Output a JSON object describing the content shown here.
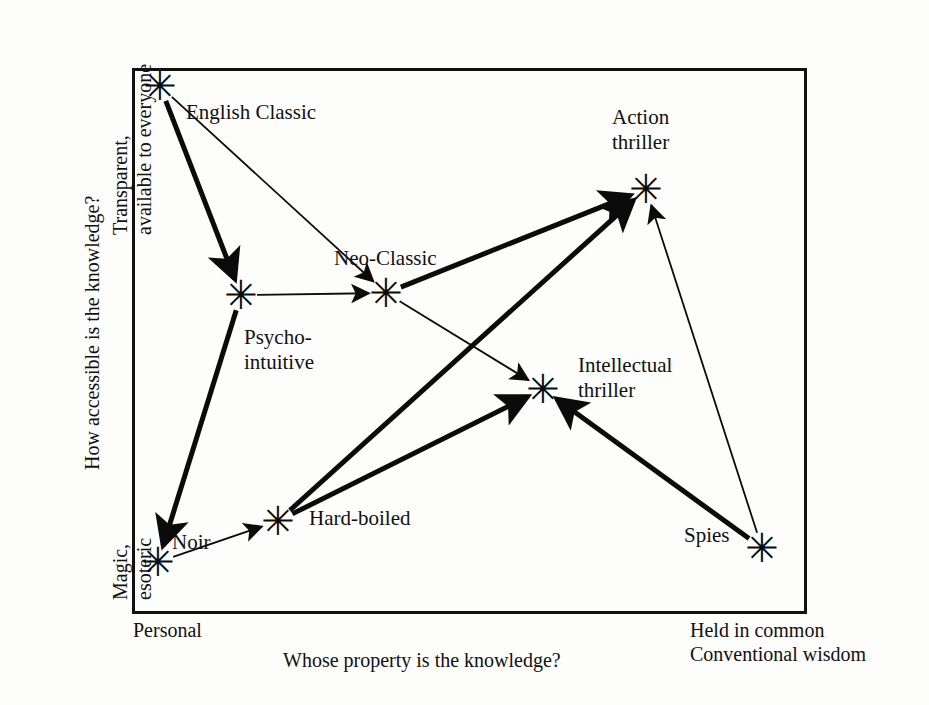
{
  "figure": {
    "kind": "two-axis positioning diagram",
    "frame": {
      "x": 132,
      "y": 68,
      "width": 675,
      "height": 546,
      "border_color": "#111111"
    },
    "background_color": "#fdfdfc"
  },
  "axes": {
    "y": {
      "title": "How accessible is the knowledge?",
      "high_label": "Transparent,\navailable to everyone",
      "low_label": "Magic,\nesoteric"
    },
    "x": {
      "title": "Whose property is the knowledge?",
      "low_label": "Personal",
      "high_label": "Held in common\nConventional wisdom"
    }
  },
  "nodes": [
    {
      "id": "english-classic",
      "label": "English Classic",
      "marker": "✳",
      "x": 160,
      "y": 86,
      "label_x": 186,
      "label_y": 100
    },
    {
      "id": "psycho-intuitive",
      "label": "Psycho-\nintuitive",
      "marker": "✳",
      "x": 241,
      "y": 295,
      "label_x": 244,
      "label_y": 325
    },
    {
      "id": "neo-classic",
      "label": "Neo-Classic",
      "marker": "✳",
      "x": 386,
      "y": 293,
      "label_x": 334,
      "label_y": 246
    },
    {
      "id": "action-thriller",
      "label": "Action\nthriller",
      "marker": "✳",
      "x": 646,
      "y": 189,
      "label_x": 612,
      "label_y": 105
    },
    {
      "id": "intellectual-thriller",
      "label": "Intellectual\nthriller",
      "marker": "✳",
      "x": 543,
      "y": 389,
      "label_x": 578,
      "label_y": 353
    },
    {
      "id": "hard-boiled",
      "label": "Hard-boiled",
      "marker": "✳",
      "x": 278,
      "y": 521,
      "label_x": 309,
      "label_y": 506
    },
    {
      "id": "noir",
      "label": "Noir",
      "marker": "✳",
      "x": 158,
      "y": 562,
      "label_x": 172,
      "label_y": 530
    },
    {
      "id": "spies",
      "label": "Spies",
      "marker": "✳",
      "x": 762,
      "y": 548,
      "label_x": 684,
      "label_y": 523
    }
  ],
  "edges": [
    {
      "from": "english-classic",
      "to": "psycho-intuitive",
      "weight": "thick"
    },
    {
      "from": "english-classic",
      "to": "neo-classic",
      "weight": "thin"
    },
    {
      "from": "psycho-intuitive",
      "to": "neo-classic",
      "weight": "thin"
    },
    {
      "from": "psycho-intuitive",
      "to": "noir",
      "weight": "thick"
    },
    {
      "from": "neo-classic",
      "to": "action-thriller",
      "weight": "thick"
    },
    {
      "from": "neo-classic",
      "to": "intellectual-thriller",
      "weight": "thin"
    },
    {
      "from": "noir",
      "to": "hard-boiled",
      "weight": "thin"
    },
    {
      "from": "hard-boiled",
      "to": "action-thriller",
      "weight": "thick"
    },
    {
      "from": "hard-boiled",
      "to": "intellectual-thriller",
      "weight": "thick"
    },
    {
      "from": "spies",
      "to": "action-thriller",
      "weight": "thin"
    },
    {
      "from": "spies",
      "to": "intellectual-thriller",
      "weight": "thick"
    }
  ]
}
